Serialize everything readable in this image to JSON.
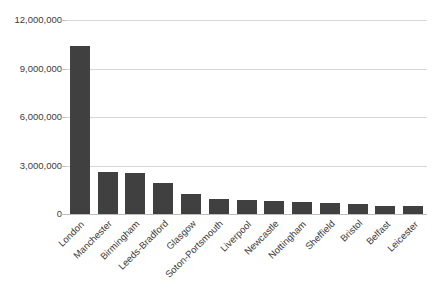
{
  "chart_data": {
    "type": "bar",
    "title": "",
    "subtitle": "",
    "xlabel": "",
    "ylabel": "",
    "ylim": [
      0,
      12000000
    ],
    "ytick_labels": [
      "12,000,000",
      "9,000,000",
      "6,000,000",
      "3,000,000",
      "0"
    ],
    "ytick_values": [
      12000000,
      9000000,
      6000000,
      3000000,
      0
    ],
    "grid": true,
    "legend": false,
    "legend_position": "none",
    "bar_color": "#404040",
    "gridline_color": "#d6d6d6",
    "background_color": "#ffffff",
    "categories": [
      "London",
      "Manchester",
      "Birmingham",
      "Leeds-Bradford",
      "Glasgow",
      "Soton-Portsmouth",
      "Liverpool",
      "Newcastle",
      "Nottingham",
      "Sheffield",
      "Bristol",
      "Belfast",
      "Leicester"
    ],
    "values": [
      10400000,
      2600000,
      2540000,
      1900000,
      1250000,
      950000,
      870000,
      820000,
      750000,
      700000,
      630000,
      520000,
      470000
    ]
  }
}
